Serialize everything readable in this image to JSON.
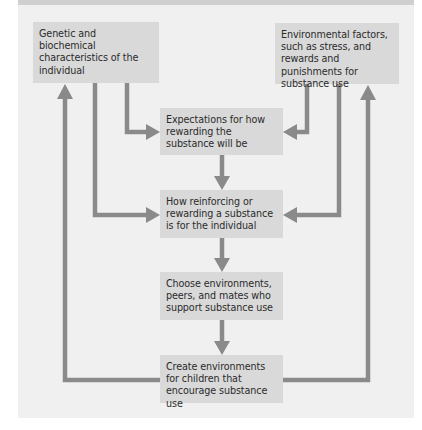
{
  "diagram": {
    "colors": {
      "background": "#f0f0f0",
      "box": "#d9d9d9",
      "arrow": "#8a8a8a",
      "text": "#2b2b2b"
    },
    "nodes": [
      {
        "id": "genetic",
        "text": "Genetic and biochemical characteristics of the individual"
      },
      {
        "id": "environmental",
        "text": "Environmental factors, such as stress, and rewards and punishments for substance use"
      },
      {
        "id": "expectations",
        "text": "Expectations for how rewarding the substance will be"
      },
      {
        "id": "reinforcing",
        "text": "How reinforcing or rewarding a substance is for the individual"
      },
      {
        "id": "choose",
        "text": "Choose environments, peers, and mates who support substance use"
      },
      {
        "id": "create",
        "text": "Create environments for children that encourage substance use"
      }
    ],
    "edges": [
      {
        "from": "genetic",
        "to": "expectations"
      },
      {
        "from": "genetic",
        "to": "reinforcing"
      },
      {
        "from": "environmental",
        "to": "expectations"
      },
      {
        "from": "environmental",
        "to": "reinforcing"
      },
      {
        "from": "expectations",
        "to": "reinforcing"
      },
      {
        "from": "reinforcing",
        "to": "choose"
      },
      {
        "from": "choose",
        "to": "create"
      },
      {
        "from": "create",
        "to": "genetic"
      },
      {
        "from": "create",
        "to": "environmental"
      }
    ]
  }
}
